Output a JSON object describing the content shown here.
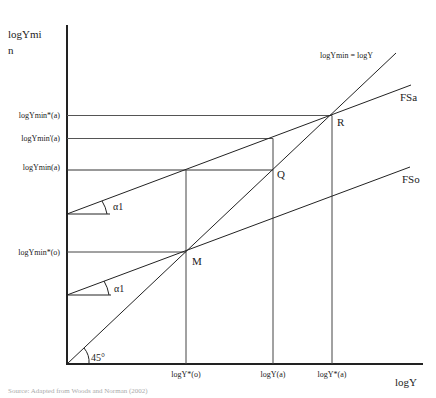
{
  "diagram": {
    "y_axis_label_line1": "logYmi",
    "y_axis_label_line2": "n",
    "x_axis_label": "logY",
    "diagonal_label": "logYmin = logY",
    "curves": {
      "fsa": "FSa",
      "fso": "FSo"
    },
    "points": {
      "r": "R",
      "q": "Q",
      "m": "M"
    },
    "y_ticks": [
      "logYmin*(a)",
      "logYmin'(a)",
      "logYmin(a)",
      "logYmin*(o)"
    ],
    "x_ticks": [
      "logY*(o)",
      "logY(a)",
      "logY*(a)"
    ],
    "angles": {
      "alpha_upper": "α1",
      "alpha_lower": "α1",
      "origin": "45°"
    },
    "caption": "Source: Adapted from Woods and Norman (2002)"
  }
}
